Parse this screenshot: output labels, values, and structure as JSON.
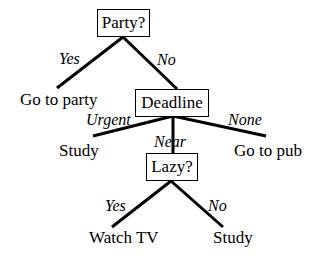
{
  "diagram": {
    "type": "decision-tree",
    "nodes": {
      "party": "Party?",
      "deadline": "Deadline",
      "lazy": "Lazy?"
    },
    "leaves": {
      "go_to_party": "Go to party",
      "study_urgent": "Study",
      "go_to_pub": "Go to pub",
      "watch_tv": "Watch TV",
      "study_lazy_no": "Study"
    },
    "edges": {
      "party_yes": "Yes",
      "party_no": "No",
      "deadline_urgent": "Urgent",
      "deadline_near": "Near",
      "deadline_none": "None",
      "lazy_yes": "Yes",
      "lazy_no": "No"
    }
  }
}
